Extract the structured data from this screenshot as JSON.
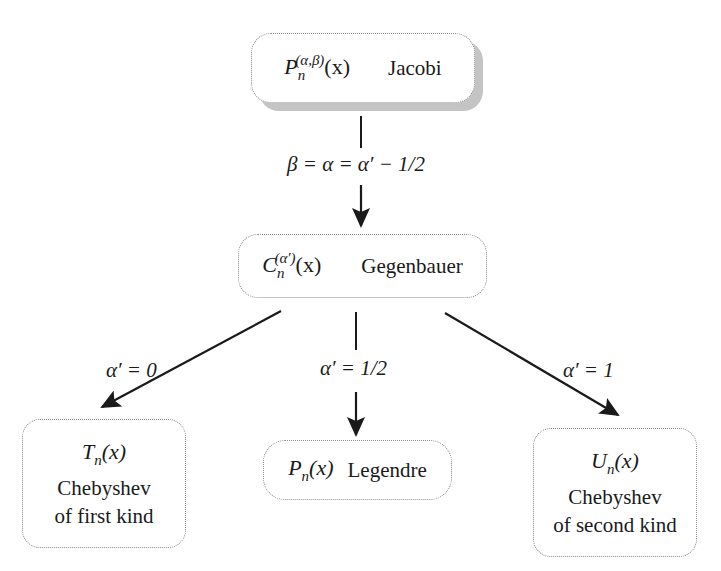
{
  "nodes": {
    "jacobi": {
      "symbol_base": "P",
      "symbol_sub": "n",
      "symbol_sup": "(α,β)",
      "symbol_arg": "(x)",
      "name": "Jacobi"
    },
    "gegenbauer": {
      "symbol_base": "C",
      "symbol_sub": "n",
      "symbol_sup": "(α′)",
      "symbol_arg": "(x)",
      "name": "Gegenbauer"
    },
    "chebyshev_first": {
      "symbol_base": "T",
      "symbol_sub": "n",
      "symbol_arg": "(x)",
      "name_line1": "Chebyshev",
      "name_line2": "of first kind"
    },
    "legendre": {
      "symbol_base": "P",
      "symbol_sub": "n",
      "symbol_arg": "(x)",
      "name": "Legendre"
    },
    "chebyshev_second": {
      "symbol_base": "U",
      "symbol_sub": "n",
      "symbol_arg": "(x)",
      "name_line1": "Chebyshev",
      "name_line2": "of second kind"
    }
  },
  "edges": {
    "jacobi_to_gegenbauer": {
      "label": "β = α = α′ − 1/2"
    },
    "gegenbauer_to_chebyshev_first": {
      "label": "α′ = 0"
    },
    "gegenbauer_to_legendre": {
      "label": "α′ = 1/2"
    },
    "gegenbauer_to_chebyshev_second": {
      "label": "α′ = 1"
    }
  },
  "colors": {
    "line": "#1a1a1a",
    "box_border": "#8a8a8a",
    "shadow": "#c4c4c4"
  }
}
